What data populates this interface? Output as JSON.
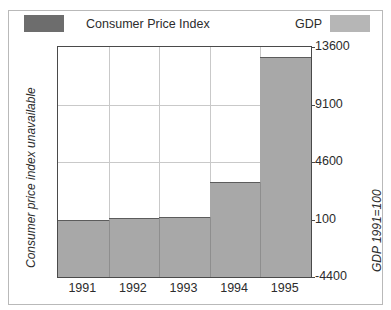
{
  "title_partial": "GDP and Consumer Price Index",
  "legend": {
    "cpi_label": "Consumer Price Index",
    "cpi_color": "#6d6d6d",
    "gdp_label": "GDP",
    "gdp_color": "#b6b6b6"
  },
  "axis": {
    "left_label": "Consumer price index unavailable",
    "right_label": "GDP 1991=100"
  },
  "chart_data": {
    "type": "bar",
    "title": "GDP and Consumer Price Index",
    "categories": [
      "1991",
      "1992",
      "1993",
      "1994",
      "1995"
    ],
    "series": [
      {
        "name": "GDP",
        "values": [
          100,
          250,
          330,
          3000,
          12800
        ],
        "color": "#a8a8a8"
      }
    ],
    "xlabel": "",
    "ylabel": "GDP 1991=100",
    "ylim": [
      -4400,
      13600
    ],
    "yticks": [
      13600,
      9100,
      4600,
      100,
      -4400
    ],
    "ytick_labels": [
      "13600",
      "9100",
      "4600",
      "100",
      "-4400"
    ],
    "grid": true,
    "legend_position": "top",
    "annotations": [
      "Consumer price index unavailable"
    ]
  }
}
